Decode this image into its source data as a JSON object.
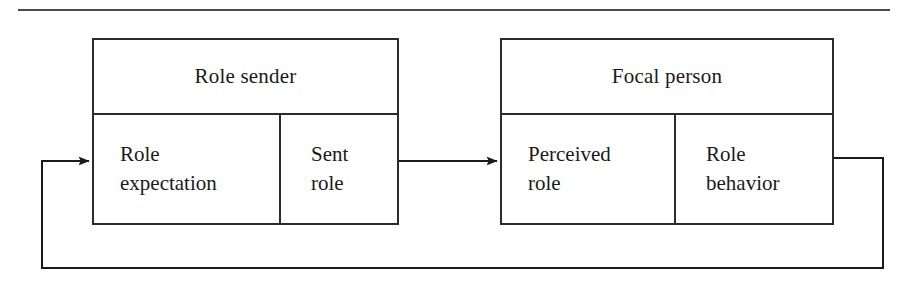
{
  "figure": {
    "rule_label": "top-horizontal-rule",
    "line_color": "#2b2b2b",
    "background_color": "#ffffff"
  },
  "groups": [
    {
      "id": "role-sender",
      "header": "Role sender",
      "cells": [
        {
          "id": "role-expectation",
          "lines": [
            "Role",
            "expectation"
          ]
        },
        {
          "id": "sent-role",
          "lines": [
            "Sent",
            "role"
          ]
        }
      ]
    },
    {
      "id": "focal-person",
      "header": "Focal person",
      "cells": [
        {
          "id": "perceived-role",
          "lines": [
            "Perceived",
            "role"
          ]
        },
        {
          "id": "role-behavior",
          "lines": [
            "Role",
            "behavior"
          ]
        }
      ]
    }
  ],
  "connectors": [
    {
      "id": "sent-role-to-perceived-role",
      "label": "forward-arrow",
      "from": "sent-role",
      "to": "perceived-role",
      "arrowhead": "right"
    },
    {
      "id": "role-behavior-feedback-loop",
      "label": "feedback-arrow",
      "from": "role-behavior",
      "to": "role-expectation",
      "arrowhead": "right"
    }
  ]
}
